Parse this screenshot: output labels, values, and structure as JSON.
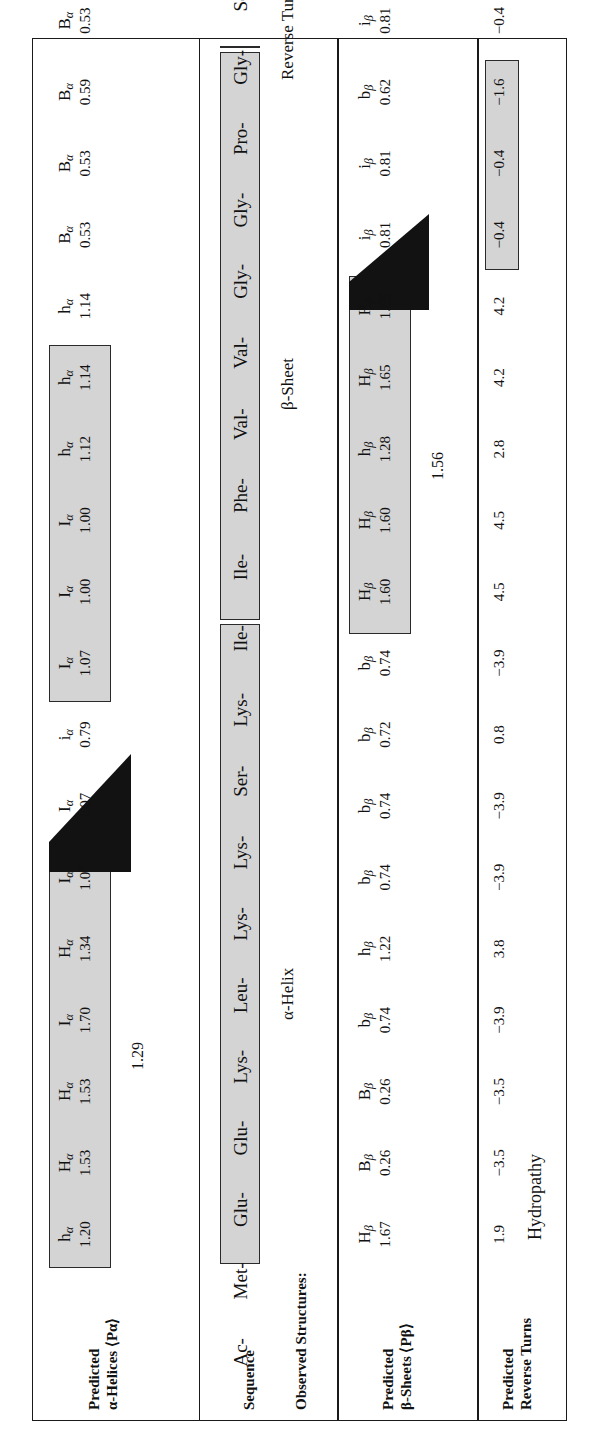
{
  "figure": {
    "residue_count": 17,
    "colors": {
      "highlight_fill": "#d4d4d4",
      "border": "#1a1a1a",
      "text": "#111111"
    }
  },
  "alpha_panel": {
    "label_line1": "Predicted",
    "label_line2": "α-Helices ⟨Pα⟩",
    "codes": [
      "hα",
      "Hα",
      "Iα",
      "Hα",
      "Iα",
      "Iα",
      "Iα",
      "hα",
      "hα",
      "Bα",
      "Bα",
      "Bα",
      "iα",
      "Bα",
      "Iα",
      "Bα",
      "iα",
      "hα"
    ],
    "letters": [
      "h",
      "H",
      "I",
      "H",
      "I",
      "I",
      "I",
      "h",
      "h",
      "B",
      "B",
      "B",
      "i",
      "B",
      "I",
      "B",
      "i",
      "h"
    ],
    "values": [
      "1.20",
      "1.53",
      "1.70",
      "1.34",
      "1.07",
      "1.07",
      "0.79",
      "1.07",
      "1.00",
      "1.12",
      "1.14",
      "1.14",
      "0.53",
      "0.53",
      "0.59",
      "0.53",
      "0.79",
      "0.53",
      "1.07",
      "0.53",
      "0.82",
      "1.17"
    ],
    "row": [
      {
        "code": "h",
        "v": "1.20",
        "box": 1
      },
      {
        "code": "H",
        "v": "1.53",
        "box": 1
      },
      {
        "code": "H",
        "v": "1.53",
        "box": 1
      },
      {
        "code": "I",
        "v": "1.70",
        "box": 1
      },
      {
        "code": "H",
        "v": "1.34",
        "box": 1
      },
      {
        "code": "I",
        "v": "1.07",
        "box": 1
      },
      {
        "code": "I",
        "v": "1.07",
        "box": 0
      },
      {
        "code": "i",
        "v": "0.79",
        "box": 0
      },
      {
        "code": "I",
        "v": "1.07",
        "box": 2
      },
      {
        "code": "I",
        "v": "1.00",
        "box": 2
      },
      {
        "code": "I",
        "v": "1.00",
        "box": 2
      },
      {
        "code": "h",
        "v": "1.12",
        "box": 2
      },
      {
        "code": "h",
        "v": "1.14",
        "box": 2
      },
      {
        "code": "h",
        "v": "1.14",
        "box": 2
      },
      {
        "code": "B",
        "v": "0.53",
        "box": 0
      },
      {
        "code": "B",
        "v": "0.53",
        "box": 0
      },
      {
        "code": "B",
        "v": "0.59",
        "box": 0
      },
      {
        "code": "B",
        "v": "0.53",
        "box": 0
      },
      {
        "code": "i",
        "v": "0.79",
        "box": 0
      },
      {
        "code": "B",
        "v": "0.53",
        "box": 0
      },
      {
        "code": "I",
        "v": "1.07",
        "box": 0
      },
      {
        "code": "B",
        "v": "0.53",
        "box": 0
      },
      {
        "code": "i",
        "v": "0.82",
        "box": 0
      },
      {
        "code": "h",
        "v": "1.17",
        "box": 0
      }
    ],
    "average": "1.29"
  },
  "sequence_panel": {
    "label_sequence": "Sequence",
    "label_observed": "Observed Structures:",
    "prefix": "Ac-",
    "residues": [
      "Met",
      "Glu",
      "Glu",
      "Lys",
      "Leu",
      "Lys",
      "Lys",
      "Ser",
      "Lys",
      "Ile",
      "Ile",
      "Phe",
      "Val",
      "Val",
      "Gly",
      "Gly",
      "Pro",
      "Gly",
      "Ser",
      "Gly",
      "Lys",
      "Gly",
      "Thr",
      "Gln"
    ],
    "sequence_text": "Ac-Met-Glu-Glu-Lys-Leu-Lys-Lys-Ser-Lys-Ile-Ile-Phe-Val-Val-Gly-Gly-Pro-Gly-Ser-Gly-Lys-Gly-Thr-Gln",
    "structures": [
      {
        "name": "α-Helix",
        "start": 0,
        "end": 8
      },
      {
        "name": "β-Sheet",
        "start": 9,
        "end": 16
      },
      {
        "name": "Reverse Turns",
        "start": 17,
        "end": 23
      }
    ]
  },
  "beta_panel": {
    "label_line1": "Predicted",
    "label_line2": "β-Sheets ⟨Pβ⟩",
    "row": [
      {
        "code": "H",
        "v": "1.67",
        "box": 0
      },
      {
        "code": "B",
        "v": "0.26",
        "box": 0
      },
      {
        "code": "B",
        "v": "0.26",
        "box": 0
      },
      {
        "code": "b",
        "v": "0.74",
        "box": 0
      },
      {
        "code": "h",
        "v": "1.22",
        "box": 0
      },
      {
        "code": "b",
        "v": "0.74",
        "box": 0
      },
      {
        "code": "b",
        "v": "0.74",
        "box": 0
      },
      {
        "code": "b",
        "v": "0.72",
        "box": 0
      },
      {
        "code": "b",
        "v": "0.74",
        "box": 0
      },
      {
        "code": "H",
        "v": "1.60",
        "box": 1
      },
      {
        "code": "H",
        "v": "1.60",
        "box": 1
      },
      {
        "code": "h",
        "v": "1.28",
        "box": 1
      },
      {
        "code": "H",
        "v": "1.65",
        "box": 1
      },
      {
        "code": "H",
        "v": "1.65",
        "box": 1
      },
      {
        "code": "i",
        "v": "0.81",
        "box": 0
      },
      {
        "code": "i",
        "v": "0.81",
        "box": 0
      },
      {
        "code": "b",
        "v": "0.62",
        "box": 0
      },
      {
        "code": "i",
        "v": "0.81",
        "box": 0
      },
      {
        "code": "b",
        "v": "0.72",
        "box": 0
      },
      {
        "code": "i",
        "v": "0.81",
        "box": 0
      },
      {
        "code": "b",
        "v": "0.74",
        "box": 0
      },
      {
        "code": "i",
        "v": "0.81",
        "box": 0
      },
      {
        "code": "h",
        "v": "1.20",
        "box": 0
      },
      {
        "code": "h",
        "v": "1.23",
        "box": 0
      }
    ],
    "average": "1.56"
  },
  "turns_panel": {
    "label_line1": "Predicted",
    "label_line2": "Reverse Turns",
    "label_series": "Hydropathy",
    "values": [
      "1.9",
      "−3.5",
      "−3.5",
      "−3.9",
      "3.8",
      "−3.9",
      "−3.9",
      "0.8",
      "−3.9",
      "4.5",
      "4.5",
      "2.8",
      "4.2",
      "4.2",
      "−0.4",
      "−1.6",
      "−0.4",
      "−0.8",
      "−0.4",
      "−3.9",
      "−0.4",
      "−0.7",
      "−3.5"
    ],
    "row": [
      {
        "v": "1.9",
        "box": 0
      },
      {
        "v": "−3.5",
        "box": 0
      },
      {
        "v": "−3.5",
        "box": 0
      },
      {
        "v": "−3.9",
        "box": 0
      },
      {
        "v": "3.8",
        "box": 0
      },
      {
        "v": "−3.9",
        "box": 0
      },
      {
        "v": "−3.9",
        "box": 0
      },
      {
        "v": "0.8",
        "box": 0
      },
      {
        "v": "−3.9",
        "box": 0
      },
      {
        "v": "4.5",
        "box": 0
      },
      {
        "v": "4.5",
        "box": 0
      },
      {
        "v": "2.8",
        "box": 0
      },
      {
        "v": "4.2",
        "box": 0
      },
      {
        "v": "4.2",
        "box": 0
      },
      {
        "v": "−0.4",
        "box": 0
      },
      {
        "v": "−0.4",
        "box": 1
      },
      {
        "v": "−1.6",
        "box": 1
      },
      {
        "v": "−0.4",
        "box": 1
      },
      {
        "v": "−0.8",
        "box": 1
      },
      {
        "v": "−0.4",
        "box": 1
      },
      {
        "v": "−3.9",
        "box": 1
      },
      {
        "v": "−0.4",
        "box": 1
      },
      {
        "v": "−0.7",
        "box": 0
      },
      {
        "v": "−3.5",
        "box": 0
      }
    ]
  }
}
